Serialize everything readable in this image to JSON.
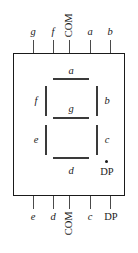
{
  "diagram": {
    "package": {
      "shape": "rectangle"
    },
    "top_pins": [
      {
        "id": "pin-g",
        "label": "g",
        "orientation": "horizontal",
        "style": "italic",
        "x": 33
      },
      {
        "id": "pin-f",
        "label": "f",
        "orientation": "horizontal",
        "style": "italic",
        "x": 53
      },
      {
        "id": "pin-com-top",
        "label": "COM",
        "orientation": "vertical",
        "style": "upright",
        "x": 69
      },
      {
        "id": "pin-a",
        "label": "a",
        "orientation": "horizontal",
        "style": "italic",
        "x": 90
      },
      {
        "id": "pin-b",
        "label": "b",
        "orientation": "horizontal",
        "style": "italic",
        "x": 110
      }
    ],
    "bottom_pins": [
      {
        "id": "pin-e",
        "label": "e",
        "orientation": "horizontal",
        "style": "italic",
        "x": 33
      },
      {
        "id": "pin-d",
        "label": "d",
        "orientation": "horizontal",
        "style": "italic",
        "x": 53
      },
      {
        "id": "pin-com-bottom",
        "label": "COM",
        "orientation": "vertical",
        "style": "upright",
        "x": 69
      },
      {
        "id": "pin-c",
        "label": "c",
        "orientation": "horizontal",
        "style": "italic",
        "x": 90
      },
      {
        "id": "pin-dp",
        "label": "DP",
        "orientation": "horizontal",
        "style": "upright",
        "x": 110
      }
    ],
    "segments": [
      {
        "id": "segment-a",
        "label": "a",
        "type": "horizontal"
      },
      {
        "id": "segment-b",
        "label": "b",
        "type": "vertical"
      },
      {
        "id": "segment-c",
        "label": "c",
        "type": "vertical"
      },
      {
        "id": "segment-d",
        "label": "d",
        "type": "horizontal"
      },
      {
        "id": "segment-e",
        "label": "e",
        "type": "vertical"
      },
      {
        "id": "segment-f",
        "label": "f",
        "type": "vertical"
      },
      {
        "id": "segment-g",
        "label": "g",
        "type": "horizontal"
      },
      {
        "id": "segment-dp",
        "label": "DP",
        "type": "dot"
      }
    ],
    "colors": {
      "outline": "#1a1a1a",
      "segment": "#3a3a3a",
      "pin": "#4a4a4a",
      "text": "#1a1a1a",
      "background": "#ffffff"
    }
  }
}
